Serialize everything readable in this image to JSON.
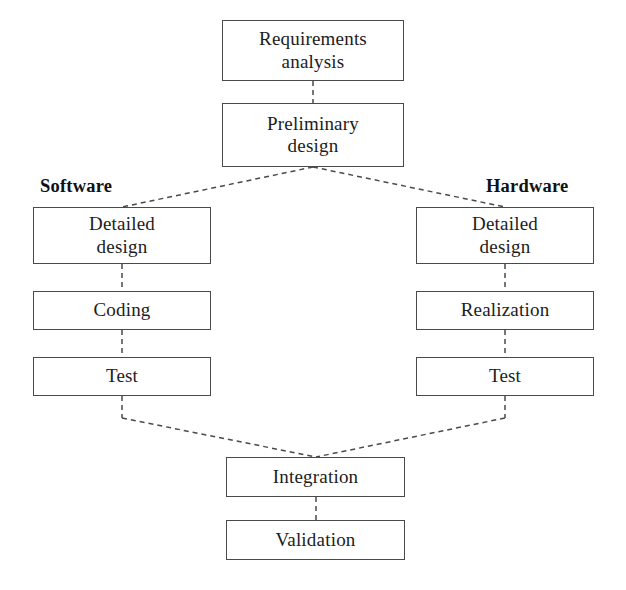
{
  "diagram": {
    "background_color": "#ffffff",
    "line_color": "#4a4a4a",
    "text_color": "#1c1c1c",
    "edge_style": "dashed",
    "column_labels": {
      "left": "Software",
      "right": "Hardware"
    },
    "nodes": {
      "requirements_analysis": "Requirements\nanalysis",
      "preliminary_design": "Preliminary\ndesign",
      "software_detailed_design": "Detailed\ndesign",
      "software_coding": "Coding",
      "software_test": "Test",
      "hardware_detailed_design": "Detailed\ndesign",
      "hardware_realization": "Realization",
      "hardware_test": "Test",
      "integration": "Integration",
      "validation": "Validation"
    }
  }
}
